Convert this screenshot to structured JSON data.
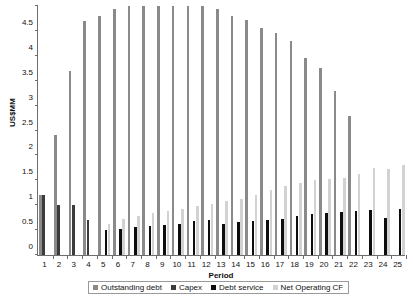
{
  "chart_data": {
    "type": "bar",
    "title": "",
    "xlabel": "Period",
    "ylabel": "US$MM",
    "ylim": [
      0,
      5
    ],
    "ytick_labels": [
      "0",
      "0.5",
      "1",
      "1.5",
      "2",
      "2.5",
      "3",
      "3.5",
      "4",
      "4.5",
      "5"
    ],
    "ytick_values": [
      0,
      0.5,
      1,
      1.5,
      2,
      2.5,
      3,
      3.5,
      4,
      4.5,
      5
    ],
    "grid": false,
    "legend_position": "bottom",
    "categories": [
      "1",
      "2",
      "3",
      "4",
      "5",
      "6",
      "7",
      "8",
      "9",
      "10",
      "11",
      "12",
      "13",
      "14",
      "15",
      "16",
      "17",
      "18",
      "19",
      "20",
      "21",
      "22",
      "23",
      "24",
      "25"
    ],
    "series": [
      {
        "name": "Outstanding debt",
        "color": "#8a8a8a",
        "values": [
          1.2,
          2.4,
          3.7,
          4.7,
          4.8,
          4.95,
          5.0,
          5.0,
          5.0,
          5.0,
          5.0,
          5.0,
          4.95,
          4.8,
          4.72,
          4.55,
          4.45,
          4.3,
          3.95,
          3.75,
          3.3,
          2.8,
          0,
          0,
          0
        ]
      },
      {
        "name": "Capex",
        "color": "#3b3b3b",
        "values": [
          1.2,
          1.0,
          1.0,
          0.7,
          0,
          0,
          0,
          0,
          0,
          0,
          0,
          0,
          0,
          0,
          0,
          0,
          0,
          0,
          0,
          0,
          0,
          0,
          0,
          0,
          0
        ]
      },
      {
        "name": "Debt service",
        "color": "#0d0d0d",
        "values": [
          0,
          0,
          0,
          0,
          0.5,
          0.53,
          0.57,
          0.58,
          0.6,
          0.62,
          0.68,
          0.7,
          0.62,
          0.66,
          0.68,
          0.7,
          0.72,
          0.78,
          0.82,
          0.84,
          0.86,
          0.88,
          0.9,
          0.75,
          0.93
        ]
      },
      {
        "name": "Net Operating CF",
        "color": "#d2d2d2",
        "values": [
          0,
          0,
          0,
          0,
          0.62,
          0.72,
          0.78,
          0.85,
          0.88,
          0.92,
          0.98,
          1.02,
          1.08,
          1.12,
          1.2,
          1.3,
          1.38,
          1.45,
          1.5,
          1.52,
          1.55,
          1.62,
          1.75,
          1.72,
          1.8
        ]
      }
    ]
  },
  "legend": {
    "items": [
      {
        "label": "Outstanding debt"
      },
      {
        "label": "Capex"
      },
      {
        "label": "Debt service"
      },
      {
        "label": "Net Operating CF"
      }
    ]
  }
}
